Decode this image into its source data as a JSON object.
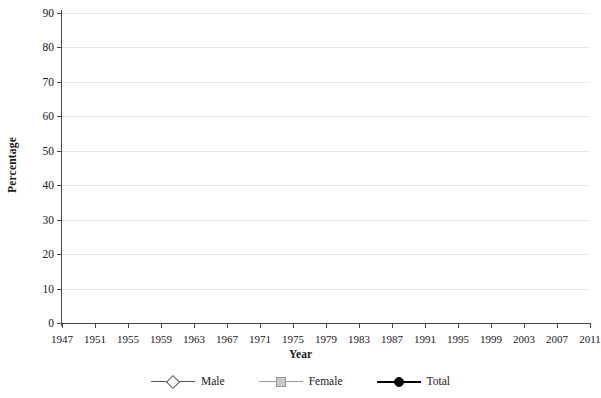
{
  "chart_data": {
    "type": "line",
    "title": "",
    "xlabel": "Year",
    "ylabel": "Percentage",
    "xlim": [
      1947,
      2011
    ],
    "ylim": [
      0,
      90
    ],
    "ytick_step": 10,
    "xtick_step": 4,
    "grid": true,
    "legend_position": "bottom",
    "x": [
      1947,
      1948,
      1949,
      1950,
      1951,
      1952,
      1953,
      1954,
      1955,
      1956,
      1957,
      1958,
      1959,
      1960,
      1961,
      1962,
      1963,
      1964,
      1965,
      1966,
      1967,
      1968,
      1969,
      1970,
      1971,
      1972,
      1973,
      1974,
      1975,
      1976,
      1977,
      1978,
      1979,
      1980,
      1981,
      1982,
      1983,
      1984,
      1985,
      1986,
      1987,
      1988,
      1989,
      1990,
      1991,
      1992,
      1993,
      1994,
      1995,
      1996,
      1997,
      1998,
      1999,
      2000,
      2001,
      2002,
      2003,
      2004,
      2005,
      2006,
      2007,
      2008,
      2009,
      2010,
      2011
    ],
    "ytick_labels": [
      "0",
      "10",
      "20",
      "30",
      "40",
      "50",
      "60",
      "70",
      "80",
      "90"
    ],
    "xtick_labels": [
      "1947",
      "1951",
      "1955",
      "1959",
      "1963",
      "1967",
      "1971",
      "1975",
      "1979",
      "1983",
      "1987",
      "1991",
      "1995",
      "1999",
      "2003",
      "2007",
      "2011"
    ],
    "series": [
      {
        "name": "Male",
        "marker": "diamond",
        "color": "#555555",
        "marker_fill": "#ffffff",
        "values": [
          84.8,
          85.5,
          85.3,
          84.9,
          84.6,
          84.1,
          83.9,
          83.6,
          83.3,
          83.4,
          83.2,
          82.8,
          82.6,
          82.4,
          82.2,
          81.6,
          81.4,
          81.0,
          80.7,
          80.4,
          80.4,
          80.1,
          79.8,
          79.7,
          79.1,
          78.6,
          78.3,
          78.1,
          77.9,
          77.5,
          77.7,
          77.8,
          77.8,
          77.4,
          77.0,
          76.6,
          76.4,
          76.4,
          76.3,
          76.3,
          76.2,
          76.2,
          76.4,
          76.4,
          75.8,
          75.8,
          75.4,
          75.1,
          75.0,
          74.9,
          75.0,
          74.9,
          74.7,
          74.8,
          74.4,
          74.1,
          73.5,
          73.3,
          73.3,
          73.5,
          73.2,
          73.0,
          72.0,
          71.2,
          70.5
        ]
      },
      {
        "name": "Female",
        "marker": "square",
        "color": "#9a9a9a",
        "marker_fill": "#c9c9c9",
        "values": [
          23.8,
          24.0,
          23.9,
          23.8,
          23.8,
          23.8,
          23.9,
          23.9,
          23.9,
          24.3,
          25.0,
          25.6,
          26.1,
          26.6,
          27.2,
          27.6,
          28.1,
          28.8,
          29.4,
          30.1,
          31.0,
          31.9,
          32.8,
          33.8,
          34.5,
          35.3,
          36.2,
          37.6,
          38.8,
          40.6,
          45.6,
          47.0,
          48.7,
          50.4,
          51.5,
          52.1,
          52.9,
          53.7,
          54.2,
          55.0,
          55.9,
          56.8,
          57.6,
          58.5,
          58.4,
          58.0,
          57.9,
          57.6,
          57.5,
          57.6,
          58.0,
          58.3,
          58.7,
          59.3,
          59.6,
          59.9,
          61.6,
          61.9,
          62.0,
          62.1,
          62.4,
          62.3,
          62.1,
          62.0,
          62.0
        ]
      },
      {
        "name": "Total",
        "marker": "circle",
        "color": "#000000",
        "marker_fill": "#000000",
        "values": [
          55.0,
          54.5,
          54.2,
          53.9,
          53.6,
          53.4,
          53.1,
          52.9,
          52.7,
          53.0,
          53.1,
          53.2,
          53.3,
          53.4,
          53.5,
          53.4,
          53.5,
          53.7,
          53.9,
          54.1,
          54.5,
          54.8,
          55.2,
          55.6,
          55.8,
          56.0,
          56.5,
          57.2,
          58.0,
          59.5,
          61.6,
          62.3,
          62.8,
          63.4,
          63.9,
          64.1,
          64.2,
          64.4,
          64.6,
          65.0,
          65.3,
          65.6,
          66.0,
          66.5,
          66.2,
          65.8,
          65.5,
          65.2,
          64.8,
          64.6,
          64.8,
          64.9,
          64.9,
          65.3,
          65.3,
          65.5,
          66.9,
          67.0,
          66.9,
          67.0,
          67.2,
          67.1,
          66.8,
          66.6,
          66.4
        ]
      }
    ]
  },
  "axes": {
    "x_title": "Year",
    "y_title": "Percentage"
  },
  "legend": {
    "items": [
      {
        "label": "Male",
        "marker": "diamond-marker"
      },
      {
        "label": "Female",
        "marker": "square-marker"
      },
      {
        "label": "Total",
        "marker": "circle-marker"
      }
    ]
  }
}
